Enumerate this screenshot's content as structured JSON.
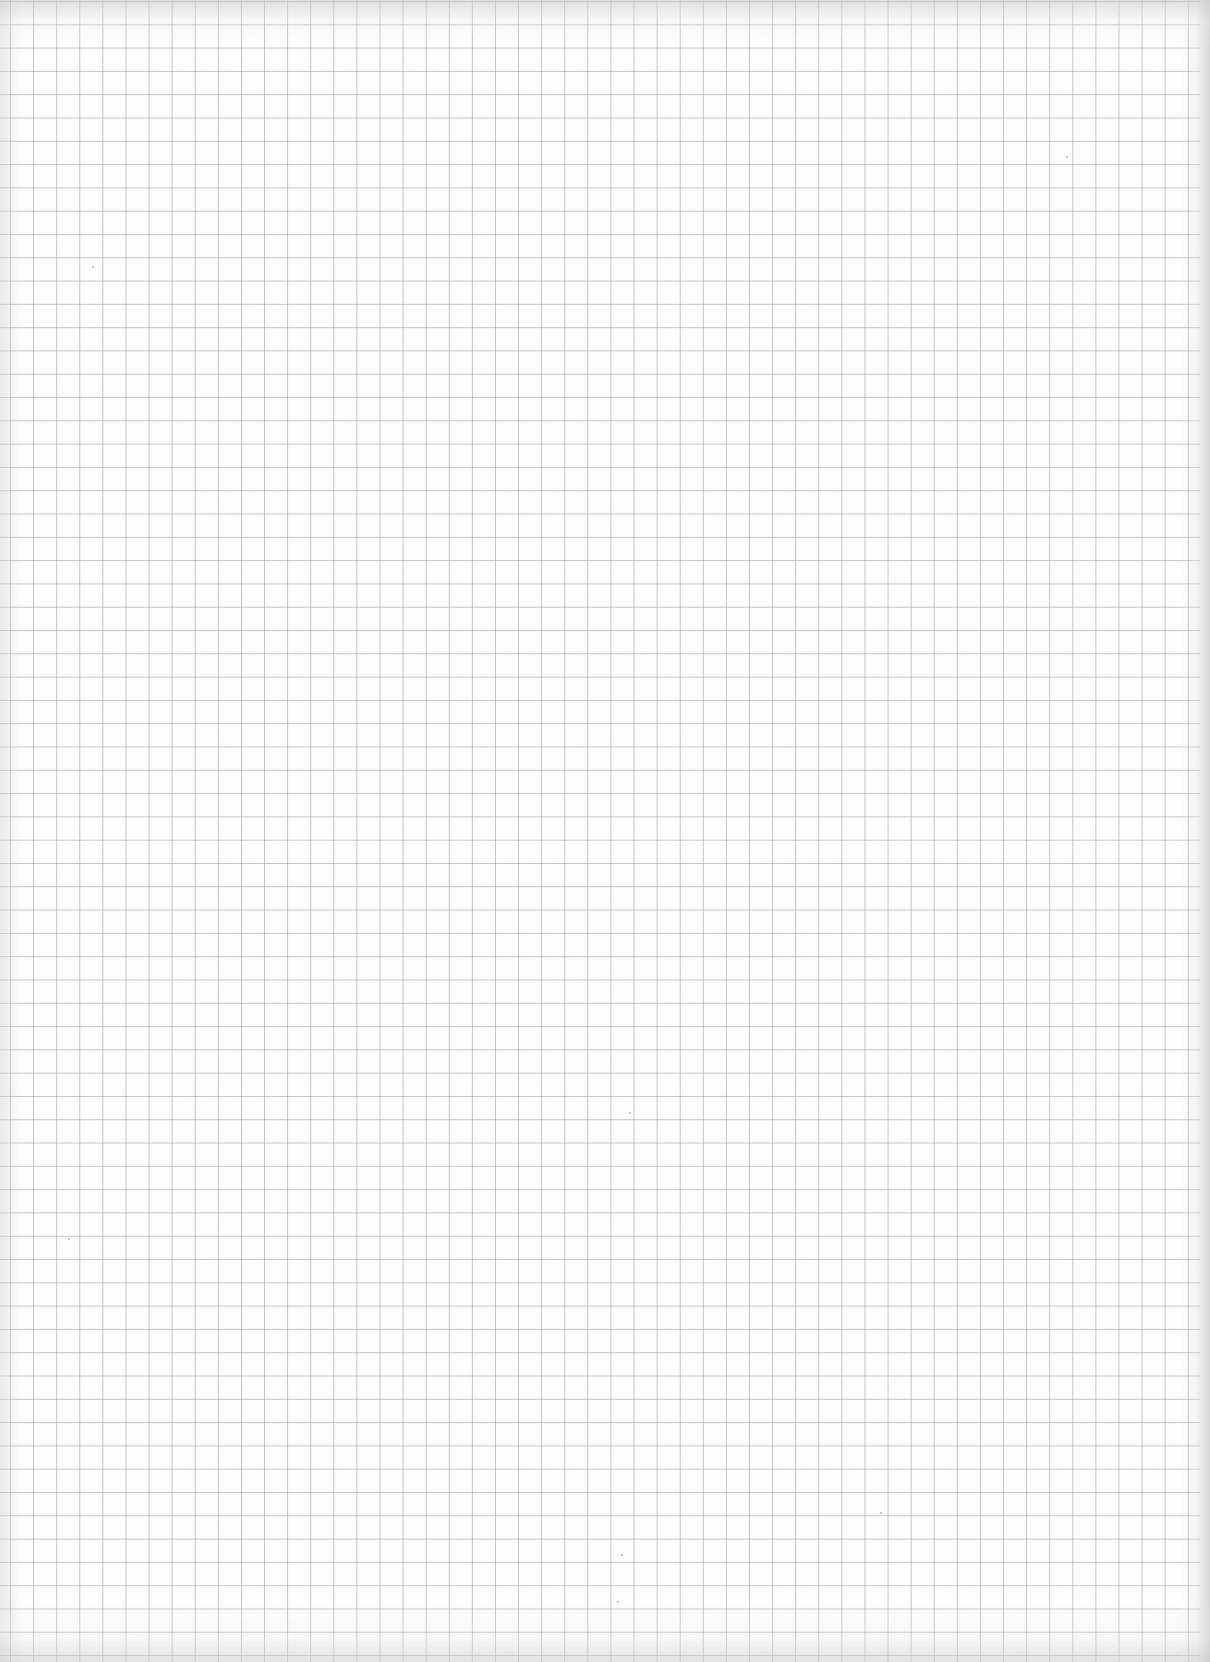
{
  "page": {
    "type": "scanned graph paper",
    "content": "blank",
    "grid": {
      "cell_size_px": 23,
      "line_color": "#969696",
      "background_color": "#fdfdfd",
      "columns_approx": 52,
      "rows_approx": 71
    },
    "text": []
  }
}
